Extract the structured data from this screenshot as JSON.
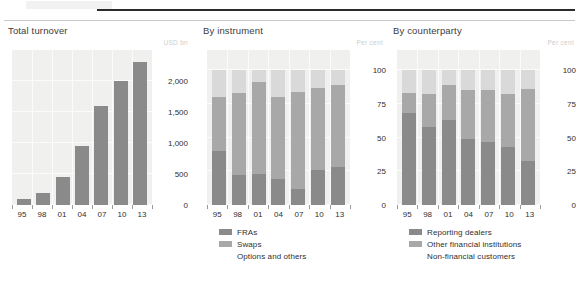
{
  "figure": {
    "ghost_header": "",
    "rules": {
      "dark_color": "#2b2b2b",
      "light_color": "#c9c9c9"
    }
  },
  "colors": {
    "series_dark": "#8a8a8a",
    "series_mid": "#a8a8a8",
    "series_light": "#d9d9d9",
    "plot_background": "#f0f0ee",
    "gridline": "#fbfbfb",
    "unit_text": "#cdcdcd"
  },
  "panels": [
    {
      "title": "Total turnover",
      "unit": "USD bn",
      "yticks": [
        "2,000",
        "1,500",
        "1,000",
        "500",
        "0"
      ],
      "xticks": [
        "95",
        "98",
        "01",
        "04",
        "07",
        "10",
        "13"
      ],
      "legend": []
    },
    {
      "title": "By instrument",
      "unit": "Per cent",
      "yticks": [
        "100",
        "75",
        "50",
        "25",
        "0"
      ],
      "xticks": [
        "95",
        "98",
        "01",
        "04",
        "07",
        "10",
        "13"
      ],
      "legend": [
        {
          "label": "FRAs",
          "color": "#8a8a8a",
          "swatch": true
        },
        {
          "label": "Swaps",
          "color": "#a8a8a8",
          "swatch": true
        },
        {
          "label": "Options and others",
          "color": "#d9d9d9",
          "swatch": false
        }
      ]
    },
    {
      "title": "By counterparty",
      "unit": "Per cent",
      "yticks": [
        "100",
        "75",
        "50",
        "25",
        "0"
      ],
      "xticks": [
        "95",
        "98",
        "01",
        "04",
        "07",
        "10",
        "13"
      ],
      "legend": [
        {
          "label": "Reporting dealers",
          "color": "#8a8a8a",
          "swatch": true
        },
        {
          "label": "Other financial institutions",
          "color": "#a8a8a8",
          "swatch": true
        },
        {
          "label": "Non-financial customers",
          "color": "#d9d9d9",
          "swatch": false
        }
      ]
    }
  ],
  "chart_data": [
    {
      "type": "bar",
      "title": "Total turnover",
      "xlabel": "",
      "ylabel": "USD bn",
      "categories": [
        "95",
        "98",
        "01",
        "04",
        "07",
        "10",
        "13"
      ],
      "values": [
        100,
        200,
        450,
        950,
        1600,
        2000,
        2300
      ],
      "ylim": [
        0,
        2500
      ],
      "yticks": [
        0,
        500,
        1000,
        1500,
        2000
      ],
      "grid": true,
      "legend": "none"
    },
    {
      "type": "bar",
      "subtype": "stacked",
      "title": "By instrument",
      "xlabel": "",
      "ylabel": "Per cent",
      "categories": [
        "95",
        "98",
        "01",
        "04",
        "07",
        "10",
        "13"
      ],
      "series": [
        {
          "name": "FRAs",
          "values": [
            40,
            22,
            23,
            19,
            12,
            26,
            28
          ]
        },
        {
          "name": "Swaps",
          "values": [
            40,
            61,
            68,
            61,
            72,
            61,
            61
          ]
        },
        {
          "name": "Options and others",
          "values": [
            20,
            17,
            9,
            20,
            16,
            13,
            11
          ]
        }
      ],
      "ylim": [
        0,
        115
      ],
      "yticks": [
        0,
        25,
        50,
        75,
        100
      ],
      "grid": true,
      "legend": "bottom-left"
    },
    {
      "type": "bar",
      "subtype": "stacked",
      "title": "By counterparty",
      "xlabel": "",
      "ylabel": "Per cent",
      "categories": [
        "95",
        "98",
        "01",
        "04",
        "07",
        "10",
        "13"
      ],
      "series": [
        {
          "name": "Reporting dealers",
          "values": [
            68,
            58,
            63,
            49,
            47,
            43,
            33
          ]
        },
        {
          "name": "Other financial institutions",
          "values": [
            15,
            24,
            26,
            36,
            38,
            39,
            53
          ]
        },
        {
          "name": "Non-financial customers",
          "values": [
            17,
            18,
            11,
            15,
            15,
            18,
            14
          ]
        }
      ],
      "ylim": [
        0,
        115
      ],
      "yticks": [
        0,
        25,
        50,
        75,
        100
      ],
      "grid": true,
      "legend": "bottom-left"
    }
  ]
}
